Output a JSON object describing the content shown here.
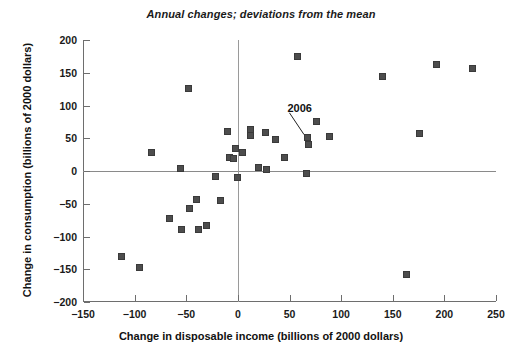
{
  "chart_data": {
    "type": "scatter",
    "title": "Annual changes; deviations from the mean",
    "xlabel": "Change in disposable income (billions of 2000 dollars)",
    "ylabel": "Change in consumption (billions of 2000 dollars)",
    "xlim": [
      -150,
      250
    ],
    "ylim": [
      -200,
      200
    ],
    "xticks": [
      -150,
      -100,
      -50,
      0,
      50,
      100,
      150,
      200,
      250
    ],
    "yticks": [
      -200,
      -150,
      -100,
      -50,
      0,
      50,
      100,
      150,
      200
    ],
    "xtick_labels": [
      "-150",
      "-100",
      "-50",
      "0",
      "50",
      "100",
      "150",
      "200",
      "250"
    ],
    "ytick_labels": [
      "-200",
      "-150",
      "-100",
      "-50",
      "0",
      "50",
      "100",
      "150",
      "200"
    ],
    "grid": false,
    "legend": null,
    "reference_lines": [
      {
        "axis": "horizontal",
        "value": 0
      },
      {
        "axis": "vertical",
        "value": 0
      }
    ],
    "marker": {
      "shape": "square",
      "color": "#4d4d4d",
      "size_px": 7
    },
    "series": [
      {
        "name": "Annual changes",
        "points": [
          {
            "x": -113,
            "y": -130
          },
          {
            "x": -95,
            "y": -147
          },
          {
            "x": -84,
            "y": 28
          },
          {
            "x": -66,
            "y": -73
          },
          {
            "x": -56,
            "y": 4
          },
          {
            "x": -55,
            "y": -90
          },
          {
            "x": -48,
            "y": 126
          },
          {
            "x": -47,
            "y": -57
          },
          {
            "x": -40,
            "y": -43
          },
          {
            "x": -38,
            "y": -90
          },
          {
            "x": -30,
            "y": -83
          },
          {
            "x": -22,
            "y": -9
          },
          {
            "x": -17,
            "y": -45
          },
          {
            "x": -10,
            "y": 61
          },
          {
            "x": -8,
            "y": 21
          },
          {
            "x": -4,
            "y": 19
          },
          {
            "x": -2,
            "y": 35
          },
          {
            "x": 0,
            "y": -10
          },
          {
            "x": 4,
            "y": 28
          },
          {
            "x": 12,
            "y": 63
          },
          {
            "x": 12,
            "y": 54
          },
          {
            "x": 20,
            "y": 6
          },
          {
            "x": 27,
            "y": 59
          },
          {
            "x": 28,
            "y": 2
          },
          {
            "x": 36,
            "y": 48
          },
          {
            "x": 45,
            "y": 20
          },
          {
            "x": 58,
            "y": 175
          },
          {
            "x": 66,
            "y": -4
          },
          {
            "x": 67,
            "y": 51
          },
          {
            "x": 68,
            "y": 40
          },
          {
            "x": 76,
            "y": 75
          },
          {
            "x": 89,
            "y": 52
          },
          {
            "x": 140,
            "y": 144
          },
          {
            "x": 163,
            "y": -158
          },
          {
            "x": 176,
            "y": 57
          },
          {
            "x": 192,
            "y": 163
          },
          {
            "x": 227,
            "y": 157
          }
        ]
      }
    ],
    "annotations": [
      {
        "text": "2006",
        "label_x": 48,
        "label_y": 95,
        "target_x": 67,
        "target_y": 51
      }
    ]
  }
}
